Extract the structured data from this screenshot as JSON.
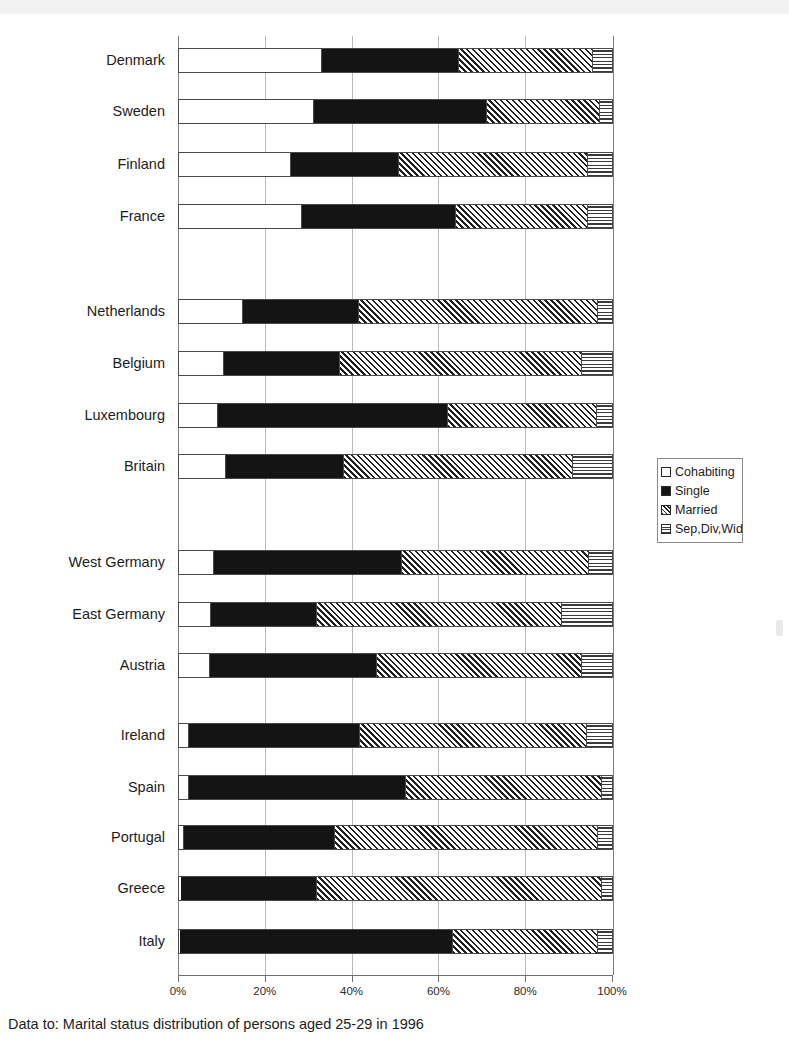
{
  "caption": "Data to: Marital status distribution of persons aged 25-29 in 1996",
  "legend": {
    "position": "right-middle",
    "entries": [
      {
        "label": "Cohabiting",
        "icon": "swatch-white"
      },
      {
        "label": "Single",
        "icon": "swatch-black"
      },
      {
        "label": "Married",
        "icon": "swatch-diagonal-hatch"
      },
      {
        "label": "Sep,Div,Wid",
        "icon": "swatch-horizontal-hatch"
      }
    ]
  },
  "chart_data": {
    "type": "bar",
    "orientation": "horizontal",
    "stacked": true,
    "normalized": "percent",
    "title": "",
    "xlabel": "",
    "ylabel": "",
    "xlim": [
      0,
      100
    ],
    "xticks": [
      "0%",
      "20%",
      "40%",
      "60%",
      "80%",
      "100%"
    ],
    "xtick_values": [
      0,
      20,
      40,
      60,
      80,
      100
    ],
    "grid": "vertical",
    "legend_entries": [
      "Cohabiting",
      "Single",
      "Married",
      "Sep,Div,Wid"
    ],
    "categories": [
      "Denmark",
      "Sweden",
      "Finland",
      "France",
      "Netherlands",
      "Belgium",
      "Luxembourg",
      "Britain",
      "West Germany",
      "East Germany",
      "Austria",
      "Ireland",
      "Spain",
      "Portugal",
      "Greece",
      "Italy"
    ],
    "series": [
      {
        "name": "Cohabiting",
        "values": [
          33.1,
          31.1,
          25.8,
          28.5,
          14.7,
          10.4,
          9.0,
          10.8,
          8.1,
          7.4,
          7.1,
          2.2,
          2.4,
          1.1,
          0.4,
          0.3
        ]
      },
      {
        "name": "Single",
        "values": [
          31.4,
          39.7,
          24.7,
          35.3,
          26.7,
          26.5,
          53.0,
          27.0,
          43.1,
          24.2,
          38.5,
          39.3,
          49.9,
          34.7,
          31.2,
          62.8
        ]
      },
      {
        "name": "Married",
        "values": [
          31.1,
          26.4,
          44.0,
          30.7,
          55.4,
          56.2,
          34.5,
          53.3,
          43.5,
          56.9,
          47.5,
          52.7,
          45.3,
          60.9,
          66.1,
          33.7
        ]
      },
      {
        "name": "Sep,Div,Wid",
        "values": [
          4.4,
          2.8,
          5.5,
          5.5,
          3.2,
          6.9,
          3.5,
          8.9,
          5.3,
          11.5,
          6.9,
          5.8,
          2.4,
          3.3,
          2.3,
          3.2
        ]
      }
    ],
    "bars": [
      {
        "category": "Denmark",
        "cohabiting": 33.1,
        "single": 31.4,
        "married": 31.1,
        "sep_div_wid": 4.4
      },
      {
        "category": "Sweden",
        "cohabiting": 31.1,
        "single": 39.7,
        "married": 26.4,
        "sep_div_wid": 2.8
      },
      {
        "category": "Finland",
        "cohabiting": 25.8,
        "single": 24.7,
        "married": 44.0,
        "sep_div_wid": 5.5
      },
      {
        "category": "France",
        "cohabiting": 28.5,
        "single": 35.3,
        "married": 30.7,
        "sep_div_wid": 5.5
      },
      {
        "category": "Netherlands",
        "cohabiting": 14.7,
        "single": 26.7,
        "married": 55.4,
        "sep_div_wid": 3.2
      },
      {
        "category": "Belgium",
        "cohabiting": 10.4,
        "single": 26.5,
        "married": 56.2,
        "sep_div_wid": 6.9
      },
      {
        "category": "Luxembourg",
        "cohabiting": 9.0,
        "single": 53.0,
        "married": 34.5,
        "sep_div_wid": 3.5
      },
      {
        "category": "Britain",
        "cohabiting": 10.8,
        "single": 27.0,
        "married": 53.3,
        "sep_div_wid": 8.9
      },
      {
        "category": "West Germany",
        "cohabiting": 8.1,
        "single": 43.1,
        "married": 43.5,
        "sep_div_wid": 5.3
      },
      {
        "category": "East Germany",
        "cohabiting": 7.4,
        "single": 24.2,
        "married": 56.9,
        "sep_div_wid": 11.5
      },
      {
        "category": "Austria",
        "cohabiting": 7.1,
        "single": 38.5,
        "married": 47.5,
        "sep_div_wid": 6.9
      },
      {
        "category": "Ireland",
        "cohabiting": 2.2,
        "single": 39.3,
        "married": 52.7,
        "sep_div_wid": 5.8
      },
      {
        "category": "Spain",
        "cohabiting": 2.4,
        "single": 49.9,
        "married": 45.3,
        "sep_div_wid": 2.4
      },
      {
        "category": "Portugal",
        "cohabiting": 1.1,
        "single": 34.7,
        "married": 60.9,
        "sep_div_wid": 3.3
      },
      {
        "category": "Greece",
        "cohabiting": 0.4,
        "single": 31.2,
        "married": 66.1,
        "sep_div_wid": 2.3
      },
      {
        "category": "Italy",
        "cohabiting": 0.3,
        "single": 62.8,
        "married": 33.7,
        "sep_div_wid": 3.2
      }
    ],
    "bar_y_centers": [
      60,
      111,
      164,
      216,
      311,
      363,
      415,
      466,
      562,
      614,
      665,
      735,
      787,
      837,
      888,
      941
    ]
  }
}
